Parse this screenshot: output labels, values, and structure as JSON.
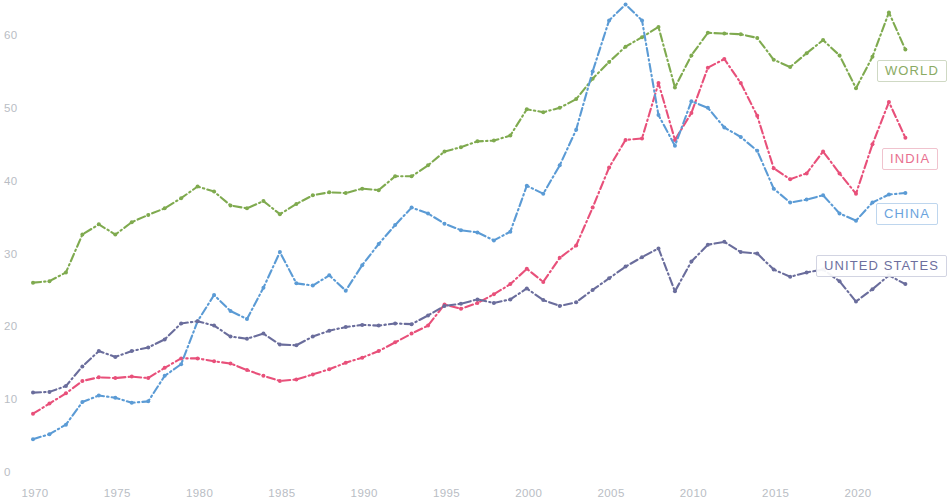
{
  "chart_data": {
    "type": "line",
    "title": "",
    "subtitle": "",
    "xlabel": "",
    "ylabel": "",
    "xlim": [
      1970,
      2023
    ],
    "ylim": [
      0,
      65
    ],
    "xticks": [
      1970,
      1975,
      1980,
      1985,
      1990,
      1995,
      2000,
      2005,
      2010,
      2015,
      2020
    ],
    "yticks": [
      0,
      10,
      20,
      30,
      40,
      50,
      60
    ],
    "grid": false,
    "legend_position": "inline-right",
    "line_style": "dash-dot with point markers",
    "x": [
      1970,
      1971,
      1972,
      1973,
      1974,
      1975,
      1976,
      1977,
      1978,
      1979,
      1980,
      1981,
      1982,
      1983,
      1984,
      1985,
      1986,
      1987,
      1988,
      1989,
      1990,
      1991,
      1992,
      1993,
      1994,
      1995,
      1996,
      1997,
      1998,
      1999,
      2000,
      2001,
      2002,
      2003,
      2004,
      2005,
      2006,
      2007,
      2008,
      2009,
      2010,
      2011,
      2012,
      2013,
      2014,
      2015,
      2016,
      2017,
      2018,
      2019,
      2020,
      2021,
      2022,
      2023
    ],
    "series": [
      {
        "name": "WORLD",
        "color": "#7faa4f",
        "values": [
          26.0,
          26.2,
          27.4,
          32.6,
          34.0,
          32.6,
          34.3,
          35.3,
          36.2,
          37.6,
          39.2,
          38.5,
          36.6,
          36.2,
          37.2,
          35.4,
          36.8,
          38.0,
          38.4,
          38.3,
          38.9,
          38.7,
          40.6,
          40.6,
          42.1,
          44.0,
          44.6,
          45.4,
          45.5,
          46.2,
          49.8,
          49.4,
          50.0,
          51.2,
          54.0,
          56.3,
          58.4,
          59.7,
          61.1,
          52.8,
          57.2,
          60.3,
          60.2,
          60.1,
          59.6,
          56.6,
          55.6,
          57.5,
          59.3,
          57.2,
          52.7,
          57.0,
          63.1,
          58.0
        ]
      },
      {
        "name": "INDIA",
        "color": "#e8507a",
        "values": [
          8.0,
          9.4,
          10.8,
          12.5,
          13.0,
          12.9,
          13.1,
          12.9,
          14.3,
          15.6,
          15.6,
          15.2,
          14.9,
          14.0,
          13.2,
          12.5,
          12.7,
          13.4,
          14.1,
          15.0,
          15.7,
          16.6,
          17.8,
          19.0,
          20.1,
          23.0,
          22.4,
          23.2,
          24.4,
          25.8,
          27.9,
          26.1,
          29.4,
          31.1,
          36.3,
          41.8,
          45.6,
          45.8,
          53.4,
          45.6,
          49.3,
          55.5,
          56.7,
          53.4,
          48.9,
          41.7,
          40.2,
          41.0,
          44.0,
          41.0,
          38.2,
          45.0,
          50.8,
          45.9
        ]
      },
      {
        "name": "CHINA",
        "color": "#5b9bd5",
        "values": [
          4.5,
          5.2,
          6.5,
          9.6,
          10.5,
          10.2,
          9.5,
          9.7,
          13.2,
          14.8,
          20.7,
          24.3,
          22.1,
          21.0,
          25.3,
          30.2,
          25.9,
          25.6,
          27.0,
          24.9,
          28.4,
          31.3,
          33.9,
          36.3,
          35.5,
          34.1,
          33.2,
          32.9,
          31.8,
          33.0,
          39.3,
          38.2,
          42.1,
          47.0,
          55.0,
          62.0,
          64.2,
          62.0,
          49.0,
          44.8,
          50.9,
          50.0,
          47.3,
          46.0,
          44.1,
          38.9,
          37.0,
          37.4,
          38.0,
          35.5,
          34.5,
          37.0,
          38.1,
          38.3
        ]
      },
      {
        "name": "UNITED STATES",
        "color": "#6a6d9c",
        "values": [
          10.9,
          11.0,
          11.8,
          14.5,
          16.6,
          15.8,
          16.6,
          17.1,
          18.2,
          20.4,
          20.7,
          20.1,
          18.6,
          18.3,
          19.0,
          17.5,
          17.4,
          18.6,
          19.4,
          19.9,
          20.2,
          20.1,
          20.4,
          20.3,
          21.5,
          22.8,
          23.1,
          23.7,
          23.2,
          23.7,
          25.2,
          23.6,
          22.8,
          23.3,
          25.0,
          26.6,
          28.2,
          29.5,
          30.7,
          24.8,
          28.9,
          31.2,
          31.6,
          30.2,
          30.0,
          27.8,
          26.8,
          27.4,
          27.8,
          26.2,
          23.4,
          25.1,
          27.0,
          25.8
        ]
      }
    ]
  },
  "legend": {
    "world": "WORLD",
    "india": "INDIA",
    "china": "CHINA",
    "united_states": "UNITED STATES"
  },
  "colors": {
    "world": "#7faa4f",
    "india": "#e8507a",
    "china": "#5b9bd5",
    "united_states": "#6a6d9c",
    "axis_text": "#b9bdc4",
    "background": "#ffffff"
  }
}
